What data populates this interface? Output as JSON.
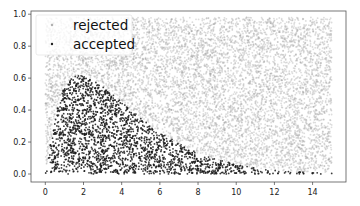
{
  "chart_data": {
    "type": "scatter",
    "title": "",
    "xlabel": "",
    "ylabel": "",
    "xlim": [
      -0.75,
      15.75
    ],
    "ylim": [
      -0.05,
      1.02
    ],
    "x_ticks": [
      0,
      2,
      4,
      6,
      8,
      10,
      12,
      14
    ],
    "y_ticks": [
      0.0,
      0.2,
      0.4,
      0.6,
      0.8,
      1.0
    ],
    "x_tick_labels": [
      "0",
      "2",
      "4",
      "6",
      "8",
      "10",
      "12",
      "14"
    ],
    "y_tick_labels": [
      "0.0",
      "0.2",
      "0.4",
      "0.6",
      "0.8",
      "1.0"
    ],
    "grid": false,
    "legend_position": "upper left",
    "series": [
      {
        "name": "rejected",
        "color": "#9a9a9a",
        "alpha": 0.35,
        "description": "uniform proposals over x in [0,15], y in [0, envelope ~0.98] lying above the target density curve",
        "x_range": [
          0,
          15
        ],
        "y_range": [
          0,
          0.98
        ]
      },
      {
        "name": "accepted",
        "color": "#1a1a1a",
        "alpha": 0.85,
        "description": "points lying under a gamma-like target density, peak ~0.62 near x~2, tailing to ~0 by x~14",
        "density_curve": {
          "x": [
            0,
            0.5,
            1,
            1.5,
            2,
            2.5,
            3,
            4,
            5,
            6,
            7,
            8,
            9,
            10,
            11,
            12,
            13,
            14,
            15
          ],
          "y": [
            0,
            0.35,
            0.55,
            0.61,
            0.62,
            0.59,
            0.55,
            0.45,
            0.35,
            0.26,
            0.19,
            0.13,
            0.09,
            0.06,
            0.04,
            0.025,
            0.015,
            0.01,
            0.005
          ]
        }
      }
    ]
  },
  "legend": {
    "items": [
      {
        "label": "rejected",
        "color": "#b0b0b0"
      },
      {
        "label": "accepted",
        "color": "#222222"
      }
    ]
  }
}
